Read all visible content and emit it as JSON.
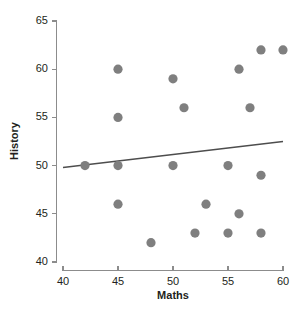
{
  "chart_data": {
    "type": "scatter",
    "title": "",
    "xlabel": "Maths",
    "ylabel": "History",
    "xlim": [
      40,
      60
    ],
    "ylim": [
      40,
      65
    ],
    "xticks": [
      40,
      45,
      50,
      55,
      60
    ],
    "yticks": [
      40,
      45,
      50,
      55,
      60,
      65
    ],
    "grid": false,
    "legend": null,
    "point_color": "#7f7f7f",
    "line_color": "#4d4d4d",
    "axis_color": "#8c8c8c",
    "points": [
      {
        "x": 42,
        "y": 50
      },
      {
        "x": 45,
        "y": 60
      },
      {
        "x": 45,
        "y": 55
      },
      {
        "x": 45,
        "y": 50
      },
      {
        "x": 45,
        "y": 46
      },
      {
        "x": 48,
        "y": 42
      },
      {
        "x": 50,
        "y": 59
      },
      {
        "x": 50,
        "y": 50
      },
      {
        "x": 51,
        "y": 56
      },
      {
        "x": 52,
        "y": 43
      },
      {
        "x": 53,
        "y": 46
      },
      {
        "x": 55,
        "y": 50
      },
      {
        "x": 55,
        "y": 43
      },
      {
        "x": 56,
        "y": 60
      },
      {
        "x": 56,
        "y": 45
      },
      {
        "x": 57,
        "y": 56
      },
      {
        "x": 58,
        "y": 62
      },
      {
        "x": 58,
        "y": 49
      },
      {
        "x": 58,
        "y": 43
      },
      {
        "x": 60,
        "y": 62
      }
    ],
    "trend_line": {
      "x_start": 40,
      "y_start": 49.8,
      "x_end": 60,
      "y_end": 52.5
    }
  }
}
